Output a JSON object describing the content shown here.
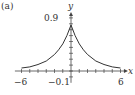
{
  "panel_label": "(a)",
  "chart_data": {
    "type": "line",
    "title": "",
    "xlabel": "x",
    "ylabel": "y",
    "xlim": [
      -6,
      6
    ],
    "ylim": [
      -0.1,
      0.9
    ],
    "x_tick_step": 1,
    "y_tick_step": 0.1,
    "x_tick_labels": [
      "-6",
      "6"
    ],
    "y_tick_labels": [
      "0.9",
      "-0.1"
    ],
    "grid": false,
    "series": [
      {
        "name": "f(x)",
        "x": [
          -6,
          -5,
          -4,
          -3,
          -2,
          -1.5,
          -1,
          -0.5,
          0,
          0.5,
          1,
          1.5,
          2,
          3,
          4,
          5,
          6
        ],
        "values": [
          0.05,
          0.07,
          0.11,
          0.17,
          0.28,
          0.36,
          0.46,
          0.6,
          0.78,
          0.6,
          0.46,
          0.36,
          0.28,
          0.17,
          0.11,
          0.07,
          0.05
        ]
      }
    ]
  },
  "labels": {
    "x_axis": "x",
    "y_axis": "y",
    "y_top": "0.9",
    "y_bottom": "−0.1",
    "x_left": "−6",
    "x_right": "6"
  }
}
